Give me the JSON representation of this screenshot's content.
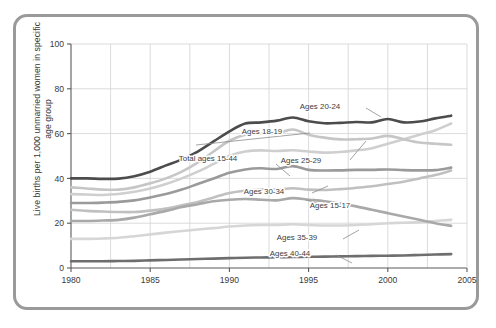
{
  "chart_data": {
    "type": "line",
    "title": "",
    "xlabel": "",
    "ylabel": "Live births per 1,000 unmarried women in specific age group",
    "xlim": [
      1980,
      2005
    ],
    "ylim": [
      0,
      100
    ],
    "xticks": [
      "1980",
      "1985",
      "1990",
      "1995",
      "2000",
      "2005"
    ],
    "yticks": [
      "0",
      "20",
      "40",
      "60",
      "80",
      "100"
    ],
    "grid": true,
    "legend_position": "inline-annotations",
    "x": [
      1980,
      1981,
      1982,
      1983,
      1984,
      1985,
      1986,
      1987,
      1988,
      1989,
      1990,
      1991,
      1992,
      1993,
      1994,
      1995,
      1996,
      1997,
      1998,
      1999,
      2000,
      2001,
      2002,
      2003,
      2004
    ],
    "series": [
      {
        "name": "Ages 20-24",
        "color": "#4c4c4c",
        "width": 2.6,
        "values": [
          40.0,
          40.0,
          39.8,
          39.9,
          41.0,
          43.0,
          45.8,
          48.5,
          52.0,
          56.5,
          61.0,
          64.5,
          65.0,
          65.8,
          67.2,
          65.5,
          64.6,
          64.8,
          65.2,
          65.0,
          66.5,
          65.0,
          65.4,
          66.8,
          68.0
        ]
      },
      {
        "name": "Ages 18-19",
        "color": "#c6c6c6",
        "width": 2.6,
        "values": [
          36.0,
          35.5,
          35.0,
          35.0,
          36.0,
          37.8,
          40.0,
          43.0,
          47.0,
          52.0,
          56.8,
          59.5,
          60.0,
          60.2,
          61.8,
          59.5,
          58.2,
          57.4,
          57.5,
          57.8,
          59.0,
          57.5,
          56.0,
          55.5,
          55.0
        ]
      },
      {
        "name": "Ages 25-29",
        "color": "#cfcfcf",
        "width": 2.6,
        "values": [
          33.0,
          32.8,
          32.6,
          33.0,
          34.0,
          35.5,
          37.5,
          40.0,
          43.0,
          46.5,
          50.0,
          52.0,
          52.5,
          52.2,
          52.6,
          52.0,
          51.5,
          51.8,
          52.5,
          53.5,
          55.5,
          57.5,
          59.5,
          61.5,
          64.5
        ]
      },
      {
        "name": "Total ages 15-44",
        "color": "#9a9a9a",
        "width": 2.6,
        "values": [
          29.0,
          29.0,
          29.2,
          29.5,
          30.2,
          31.5,
          33.0,
          35.0,
          37.5,
          40.0,
          42.5,
          44.0,
          44.5,
          44.2,
          45.5,
          43.8,
          43.5,
          43.6,
          43.8,
          43.8,
          44.0,
          43.7,
          43.6,
          43.7,
          44.8
        ]
      },
      {
        "name": "Ages 30-34",
        "color": "#c0c0c0",
        "width": 2.6,
        "values": [
          26.0,
          25.5,
          25.2,
          25.0,
          25.0,
          25.6,
          26.5,
          28.0,
          29.5,
          31.5,
          33.5,
          34.5,
          35.0,
          35.0,
          35.6,
          35.0,
          34.8,
          35.2,
          35.8,
          36.5,
          37.5,
          38.5,
          40.0,
          41.5,
          43.5
        ]
      },
      {
        "name": "Ages 15-17",
        "color": "#a9a9a9",
        "width": 2.6,
        "values": [
          21.0,
          21.0,
          21.2,
          21.5,
          22.5,
          24.0,
          25.5,
          27.2,
          28.5,
          29.8,
          30.5,
          30.8,
          30.5,
          30.2,
          31.2,
          30.5,
          29.8,
          28.8,
          27.5,
          26.0,
          24.5,
          23.0,
          21.5,
          20.0,
          18.8
        ]
      },
      {
        "name": "Ages 35-39",
        "color": "#d6d6d6",
        "width": 2.6,
        "values": [
          13.0,
          13.0,
          13.2,
          13.5,
          14.2,
          15.0,
          15.8,
          16.5,
          17.2,
          17.8,
          18.5,
          19.0,
          19.2,
          19.2,
          19.5,
          19.2,
          19.0,
          19.0,
          19.2,
          19.5,
          20.0,
          20.2,
          20.5,
          21.0,
          21.5
        ]
      },
      {
        "name": "Ages 40-44",
        "color": "#6e6e6e",
        "width": 2.6,
        "values": [
          3.0,
          3.0,
          3.0,
          3.1,
          3.2,
          3.4,
          3.6,
          3.8,
          4.0,
          4.2,
          4.4,
          4.6,
          4.7,
          4.8,
          4.9,
          5.0,
          5.1,
          5.2,
          5.3,
          5.4,
          5.5,
          5.6,
          5.8,
          6.0,
          6.2
        ]
      }
    ],
    "annotations": [
      {
        "text": "Ages 20-24",
        "x": 320,
        "y": 109
      },
      {
        "text": "Ages 18-19",
        "x": 262,
        "y": 134
      },
      {
        "text": "Total ages 15-44",
        "x": 208,
        "y": 161
      },
      {
        "text": "Ages 25-29",
        "x": 301,
        "y": 163
      },
      {
        "text": "Ages 30-34",
        "x": 264,
        "y": 194
      },
      {
        "text": "Ages 15-17",
        "x": 330,
        "y": 208
      },
      {
        "text": "Ages 35-39",
        "x": 297,
        "y": 240
      },
      {
        "text": "Ages 40-44",
        "x": 290,
        "y": 256
      }
    ],
    "leader_lines": [
      {
        "x1": 366,
        "y1": 108,
        "x2": 381,
        "y2": 117
      },
      {
        "x1": 310,
        "y1": 133,
        "x2": 196,
        "y2": 145
      },
      {
        "x1": 276,
        "y1": 164,
        "x2": 290,
        "y2": 176
      },
      {
        "x1": 350,
        "y1": 160,
        "x2": 366,
        "y2": 141
      },
      {
        "x1": 312,
        "y1": 193,
        "x2": 328,
        "y2": 186
      },
      {
        "x1": 328,
        "y1": 206,
        "x2": 306,
        "y2": 200
      },
      {
        "x1": 343,
        "y1": 239,
        "x2": 359,
        "y2": 230
      },
      {
        "x1": 336,
        "y1": 255,
        "x2": 352,
        "y2": 263
      }
    ]
  },
  "axis": {
    "y_label_text": "Live births per 1,000 unmarried women in specific age group"
  }
}
